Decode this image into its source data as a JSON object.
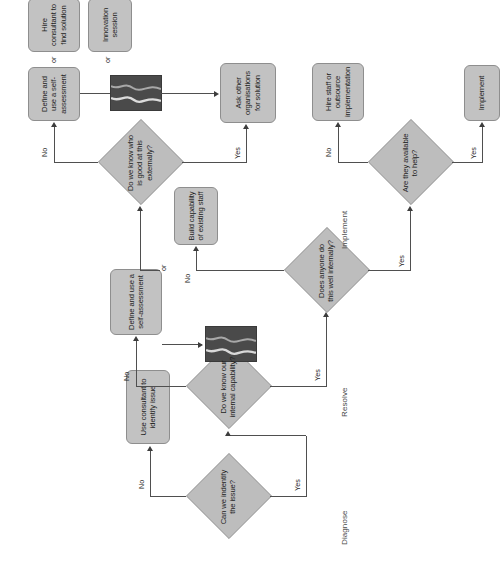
{
  "diagram": {
    "orientation": "rotated-90-ccw",
    "colors": {
      "node_fill": "#c2c2c2",
      "node_border": "#8e8e8e",
      "decision_fill": "#bdbdbd",
      "connector": "#4f4f4f",
      "redaction": "#4a4a4a",
      "phase_text": "#4a4a4a",
      "page_background": "#ffffff"
    }
  },
  "phases": [
    {
      "id": "diagnose",
      "label": "Diagnose"
    },
    {
      "id": "resolve",
      "label": "Resolve"
    },
    {
      "id": "implement",
      "label": "Implement"
    }
  ],
  "decisions": [
    {
      "id": "d1",
      "label": "Can we indentify the issue?"
    },
    {
      "id": "d2",
      "label": "Do we know our internal capability?"
    },
    {
      "id": "d3",
      "label": "Does anyone do this well internally?"
    },
    {
      "id": "d4",
      "label": "Do we know who is good at this externally?"
    },
    {
      "id": "d5",
      "label": "Are they available to help?"
    }
  ],
  "processes": [
    {
      "id": "p1",
      "label": "Use consultant to identify issue"
    },
    {
      "id": "p2",
      "label": "Define and use a self-assessment"
    },
    {
      "id": "p3",
      "label": "Build capability of existing staff"
    },
    {
      "id": "p4",
      "label": "Ask other organisations for solution"
    },
    {
      "id": "p5",
      "label": "Define and use a self-assessment"
    },
    {
      "id": "p6",
      "label": "Hire consultant to find solution"
    },
    {
      "id": "p7",
      "label": "Innovation session"
    },
    {
      "id": "p8",
      "label": "Hire staff or outsource implementation"
    },
    {
      "id": "p9",
      "label": "Implement"
    }
  ],
  "edge_labels": {
    "d1_no": "No",
    "d1_yes": "Yes",
    "d2_no": "No",
    "d2_yes": "Yes",
    "d3_no": "No",
    "d3_yes": "Yes",
    "d4_no": "No",
    "d4_yes": "Yes",
    "d5_no": "No",
    "d5_yes": "Yes"
  },
  "connectors": {
    "or_1": "or",
    "or_2": "or",
    "or_3": "or"
  },
  "redactions": [
    {
      "id": "r1",
      "note": "scribbled-out block below the internal capability decision"
    },
    {
      "id": "r2",
      "note": "scribbled-out block between external knowledge decision and options"
    }
  ]
}
